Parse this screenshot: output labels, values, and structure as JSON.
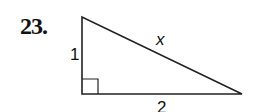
{
  "problem": {
    "number": "23.",
    "figure": "right-triangle",
    "labels": {
      "vertical_leg": "1",
      "hypotenuse": "x",
      "horizontal_leg": "2"
    },
    "right_angle_marker": true
  }
}
